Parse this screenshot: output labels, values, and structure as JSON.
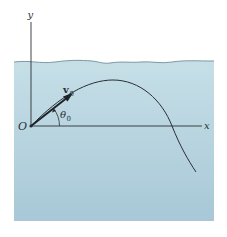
{
  "figure": {
    "colors": {
      "water_top": "#c3dde6",
      "water_bottom": "#a9c9d8",
      "surface_line": "#6f8f9c",
      "ink": "#2a2f35",
      "background": "#ffffff"
    },
    "labels": {
      "y_axis": "y",
      "x_axis": "x",
      "origin": "O",
      "velocity": "v",
      "velocity_subscript": "0",
      "angle": "θ",
      "angle_subscript": "0"
    }
  }
}
